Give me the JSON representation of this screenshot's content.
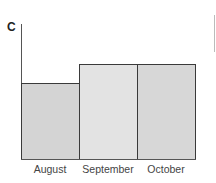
{
  "chart_data": {
    "type": "bar",
    "title": "",
    "panel_label": "C",
    "categories": [
      "August",
      "September",
      "October"
    ],
    "values": [
      56,
      70,
      70
    ],
    "xlabel": "",
    "ylabel": "",
    "ylim": [
      0,
      100
    ],
    "grid": false,
    "legend": null,
    "colors": [
      "#d4d4d4",
      "#e3e3e3",
      "#d7d7d7"
    ],
    "note": "Y-axis has no tick labels; values are relative heights (bars start at baseline, August lower, September and October equal)."
  }
}
